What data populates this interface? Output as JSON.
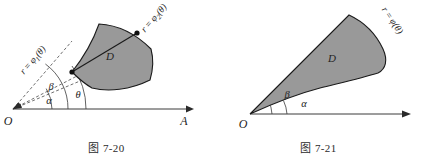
{
  "page": {
    "background_color": "#ffffff",
    "width": 425,
    "height": 161
  },
  "style": {
    "region_fill": "#999999",
    "region_stroke": "#1a1a1a",
    "axis_color": "#3a3a3a",
    "dashed_color": "#4a4a4a",
    "text_color": "#232323"
  },
  "figures": [
    {
      "id": "figure-7-20",
      "caption": "图 7-20",
      "origin_label": "O",
      "axis_end_label": "A",
      "region_label": "D",
      "inner_curve_label_parts": {
        "r": "r",
        "eq": "=",
        "phi": "φ",
        "sub": "1",
        "arg": "(θ)"
      },
      "outer_curve_label_parts": {
        "r": "r",
        "eq": "=",
        "phi": "φ",
        "sub": "2",
        "arg": "(θ)"
      },
      "inner_curve_label": "r = φ₁(θ)",
      "outer_curve_label": "r = φ₂(θ)",
      "angles": [
        {
          "name": "alpha",
          "symbol": "α"
        },
        {
          "name": "theta",
          "symbol": "θ"
        },
        {
          "name": "beta",
          "symbol": "β"
        }
      ]
    },
    {
      "id": "figure-7-21",
      "caption": "图 7-21",
      "origin_label": "O",
      "axis_end_label": "",
      "region_label": "D",
      "curve_label_parts": {
        "r": "r",
        "eq": "=",
        "phi": "φ",
        "arg": "(θ)"
      },
      "curve_label": "r = φ(θ)",
      "angles": [
        {
          "name": "alpha",
          "symbol": "α"
        },
        {
          "name": "beta",
          "symbol": "β"
        }
      ]
    }
  ]
}
